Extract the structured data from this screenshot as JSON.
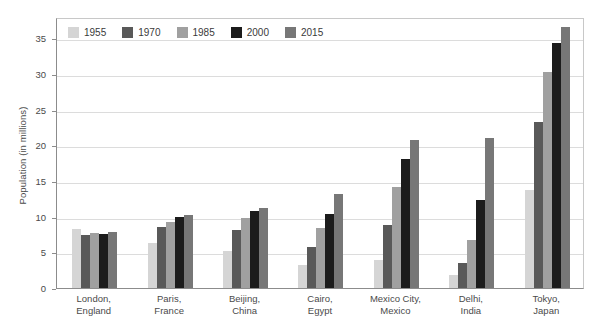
{
  "chart_data": {
    "type": "bar",
    "title": "",
    "subtitle": "",
    "xlabel": "",
    "ylabel": "Population (in millions)",
    "ylim": [
      0,
      38
    ],
    "yticks": [
      0,
      5,
      10,
      15,
      20,
      25,
      30,
      35
    ],
    "ytick_labels": [
      "0",
      "5",
      "10",
      "15",
      "20",
      "25",
      "30",
      "35"
    ],
    "grid": true,
    "legend_position": "top-left-inside",
    "categories": [
      "London, England",
      "Paris, France",
      "Beijing, China",
      "Cairo, Egypt",
      "Mexico City, Mexico",
      "Delhi, India",
      "Tokyo, Japan"
    ],
    "category_lines": [
      [
        "London,",
        "England"
      ],
      [
        "Paris,",
        "France"
      ],
      [
        "Beijing,",
        "China"
      ],
      [
        "Cairo,",
        "Egypt"
      ],
      [
        "Mexico City,",
        "Mexico"
      ],
      [
        "Delhi,",
        "India"
      ],
      [
        "Tokyo,",
        "Japan"
      ]
    ],
    "series": [
      {
        "name": "1955",
        "color": "#d5d5d5",
        "values": [
          8.3,
          6.3,
          5.2,
          3.2,
          3.9,
          1.8,
          13.8
        ]
      },
      {
        "name": "1970",
        "color": "#595959",
        "values": [
          7.5,
          8.5,
          8.1,
          5.8,
          8.8,
          3.5,
          23.3
        ]
      },
      {
        "name": "1985",
        "color": "#a0a0a0",
        "values": [
          7.7,
          9.3,
          9.8,
          8.4,
          14.2,
          6.8,
          30.3
        ]
      },
      {
        "name": "2000",
        "color": "#1c1c1c",
        "values": [
          7.6,
          10.0,
          10.8,
          10.4,
          18.1,
          12.4,
          34.4
        ]
      },
      {
        "name": "2015",
        "color": "#777777",
        "values": [
          7.8,
          10.2,
          11.2,
          13.2,
          20.8,
          21.0,
          36.6
        ]
      }
    ]
  },
  "colors": {
    "axis": "#8c8c8c",
    "grid": "#dcdcdc",
    "text": "#4a4a4a",
    "background": "#ffffff"
  }
}
